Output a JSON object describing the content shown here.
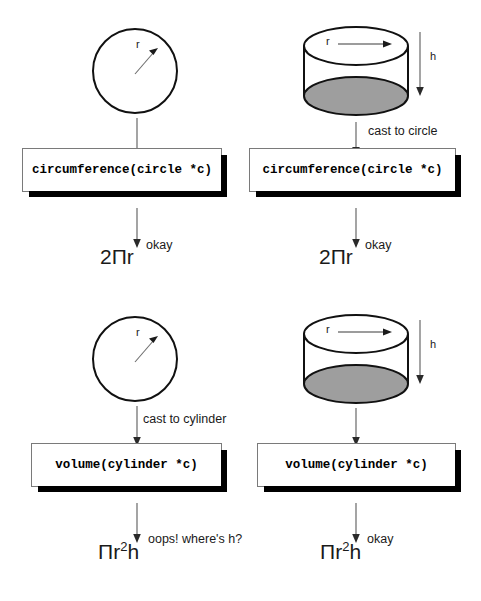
{
  "diagram": {
    "colors": {
      "ink": "#111111",
      "shadow": "#000000",
      "cylinder_base_fill": "#9e9e9e",
      "box_border": "#7a7a7a",
      "box_fill": "#ffffff",
      "arrow": "#555555",
      "page_bg": "#ffffff"
    },
    "shapes": {
      "circle_radius_label": "r",
      "cylinder_radius_label": "r",
      "cylinder_height_label": "h"
    },
    "panels": [
      {
        "id": "circle-to-circumference",
        "shape": "circle",
        "cast_label": "",
        "code": "circumference(circle *c)",
        "result_label": "okay",
        "formula_prefix": "2Πr",
        "formula_base": "2Πr",
        "formula_exponent": "",
        "formula_suffix": ""
      },
      {
        "id": "cylinder-to-circumference",
        "shape": "cylinder",
        "cast_label": "cast to circle",
        "code": "circumference(circle *c)",
        "result_label": "okay",
        "formula_prefix": "2Πr",
        "formula_base": "2Πr",
        "formula_exponent": "",
        "formula_suffix": ""
      },
      {
        "id": "circle-to-volume",
        "shape": "circle",
        "cast_label": "cast to cylinder",
        "code": "volume(cylinder *c)",
        "result_label": "oops! where's h?",
        "formula_prefix": "Πr",
        "formula_base": "Πr",
        "formula_exponent": "2",
        "formula_suffix": "h"
      },
      {
        "id": "cylinder-to-volume",
        "shape": "cylinder",
        "cast_label": "",
        "code": "volume(cylinder *c)",
        "result_label": "okay",
        "formula_prefix": "Πr",
        "formula_base": "Πr",
        "formula_exponent": "2",
        "formula_suffix": "h"
      }
    ]
  }
}
